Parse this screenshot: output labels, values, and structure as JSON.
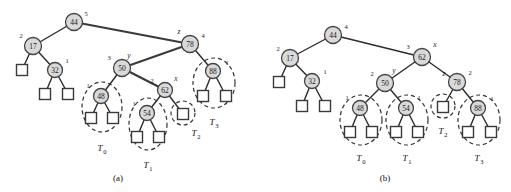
{
  "figure": {
    "kind": "avl-tree-trinode-restructuring-diagram",
    "background_color": "#ffffff",
    "node_fill_color": "#d9d9d9",
    "node_stroke_color": "#444444",
    "external_node_fill_color": "#ffffff",
    "edge_color": "#2b2b2b",
    "subtree_outline_color": "#333333"
  },
  "panels": [
    {
      "id": "a",
      "caption": "(a)",
      "caption_pos": {
        "x": 118,
        "y": 178
      },
      "nodes": [
        {
          "name": "node-44",
          "key": "44",
          "x": 74,
          "y": 22,
          "r": 8.5,
          "height": "5",
          "height_pos": {
            "x": 86,
            "y": 13
          },
          "var": "",
          "var_pos": null
        },
        {
          "name": "node-17",
          "key": "17",
          "x": 33,
          "y": 46,
          "r": 8.5,
          "height": "2",
          "height_pos": {
            "x": 21,
            "y": 35
          },
          "var": "",
          "var_pos": null
        },
        {
          "name": "node-32",
          "key": "32",
          "x": 55,
          "y": 70,
          "r": 7.5,
          "height": "1",
          "height_pos": {
            "x": 67,
            "y": 60
          },
          "var": "",
          "var_pos": null
        },
        {
          "name": "node-78",
          "key": "78",
          "x": 190,
          "y": 44,
          "r": 8.5,
          "height": "4",
          "height_pos": {
            "x": 203,
            "y": 35
          },
          "var": "z",
          "var_pos": {
            "x": 179,
            "y": 31
          }
        },
        {
          "name": "node-50",
          "key": "50",
          "x": 122,
          "y": 68,
          "r": 8.5,
          "height": "3",
          "height_pos": {
            "x": 109,
            "y": 57
          },
          "var": "y",
          "var_pos": {
            "x": 129,
            "y": 55
          }
        },
        {
          "name": "node-88",
          "key": "88",
          "x": 213,
          "y": 71,
          "r": 7.5,
          "height": "1",
          "height_pos": {
            "x": 227,
            "y": 62
          },
          "var": "",
          "var_pos": null
        },
        {
          "name": "node-48",
          "key": "48",
          "x": 101,
          "y": 96,
          "r": 7.5,
          "height": "1",
          "height_pos": {
            "x": 88,
            "y": 85
          },
          "var": "",
          "var_pos": null
        },
        {
          "name": "node-62",
          "key": "62",
          "x": 165,
          "y": 90,
          "r": 7.5,
          "height": "2",
          "height_pos": {
            "x": 152,
            "y": 80
          },
          "var": "x",
          "var_pos": {
            "x": 176,
            "y": 78
          }
        },
        {
          "name": "node-54",
          "key": "54",
          "x": 147,
          "y": 113,
          "r": 7.5,
          "height": "1",
          "height_pos": {
            "x": 134,
            "y": 103
          },
          "var": "",
          "var_pos": null
        }
      ],
      "external_nodes": [
        {
          "name": "ext-17-left",
          "x": 22,
          "y": 70,
          "size": 11
        },
        {
          "name": "ext-32-left",
          "x": 45,
          "y": 94,
          "size": 11
        },
        {
          "name": "ext-32-right",
          "x": 68,
          "y": 94,
          "size": 11
        },
        {
          "name": "ext-48-left",
          "x": 91,
          "y": 118,
          "size": 11
        },
        {
          "name": "ext-48-right",
          "x": 113,
          "y": 118,
          "size": 11
        },
        {
          "name": "ext-54-left",
          "x": 137,
          "y": 137,
          "size": 11
        },
        {
          "name": "ext-54-right",
          "x": 159,
          "y": 137,
          "size": 11
        },
        {
          "name": "ext-62-right",
          "x": 183,
          "y": 114,
          "size": 11
        },
        {
          "name": "ext-88-left",
          "x": 203,
          "y": 96,
          "size": 11
        },
        {
          "name": "ext-88-right",
          "x": 226,
          "y": 96,
          "size": 11
        }
      ],
      "edges": [
        {
          "name": "edge-44-17",
          "x1": 74,
          "y1": 22,
          "x2": 33,
          "y2": 46,
          "thick": false
        },
        {
          "name": "edge-44-78",
          "x1": 74,
          "y1": 22,
          "x2": 190,
          "y2": 44,
          "thick": true
        },
        {
          "name": "edge-17-ext",
          "x1": 33,
          "y1": 46,
          "x2": 22,
          "y2": 70,
          "thick": false
        },
        {
          "name": "edge-17-32",
          "x1": 33,
          "y1": 46,
          "x2": 55,
          "y2": 70,
          "thick": false
        },
        {
          "name": "edge-32-extl",
          "x1": 55,
          "y1": 70,
          "x2": 45,
          "y2": 94,
          "thick": false
        },
        {
          "name": "edge-32-extr",
          "x1": 55,
          "y1": 70,
          "x2": 68,
          "y2": 94,
          "thick": false
        },
        {
          "name": "edge-78-50",
          "x1": 190,
          "y1": 44,
          "x2": 122,
          "y2": 68,
          "thick": true
        },
        {
          "name": "edge-78-88",
          "x1": 190,
          "y1": 44,
          "x2": 213,
          "y2": 71,
          "thick": false
        },
        {
          "name": "edge-50-48",
          "x1": 122,
          "y1": 68,
          "x2": 101,
          "y2": 96,
          "thick": false
        },
        {
          "name": "edge-50-62",
          "x1": 122,
          "y1": 68,
          "x2": 165,
          "y2": 90,
          "thick": true
        },
        {
          "name": "edge-48-extl",
          "x1": 101,
          "y1": 96,
          "x2": 91,
          "y2": 118,
          "thick": false
        },
        {
          "name": "edge-48-extr",
          "x1": 101,
          "y1": 96,
          "x2": 113,
          "y2": 118,
          "thick": false
        },
        {
          "name": "edge-62-54",
          "x1": 165,
          "y1": 90,
          "x2": 147,
          "y2": 113,
          "thick": false
        },
        {
          "name": "edge-62-extr",
          "x1": 165,
          "y1": 90,
          "x2": 183,
          "y2": 114,
          "thick": false
        },
        {
          "name": "edge-54-extl",
          "x1": 147,
          "y1": 113,
          "x2": 137,
          "y2": 137,
          "thick": false
        },
        {
          "name": "edge-54-extr",
          "x1": 147,
          "y1": 113,
          "x2": 159,
          "y2": 137,
          "thick": false
        },
        {
          "name": "edge-88-extl",
          "x1": 213,
          "y1": 71,
          "x2": 203,
          "y2": 96,
          "thick": false
        },
        {
          "name": "edge-88-extr",
          "x1": 213,
          "y1": 71,
          "x2": 226,
          "y2": 96,
          "thick": false
        }
      ],
      "subtrees": [
        {
          "name": "subtree-T0",
          "label": "T",
          "sub": "0",
          "label_pos": {
            "x": 102,
            "y": 148
          },
          "outline": {
            "cx": 102,
            "cy": 107,
            "rx": 20,
            "ry": 25
          }
        },
        {
          "name": "subtree-T1",
          "label": "T",
          "sub": "1",
          "label_pos": {
            "x": 148,
            "y": 165
          },
          "outline": {
            "cx": 148,
            "cy": 124,
            "rx": 19,
            "ry": 26
          }
        },
        {
          "name": "subtree-T2",
          "label": "T",
          "sub": "2",
          "label_pos": {
            "x": 196,
            "y": 133
          },
          "outline": {
            "cx": 183,
            "cy": 113,
            "rx": 12,
            "ry": 12
          }
        },
        {
          "name": "subtree-T3",
          "label": "T",
          "sub": "3",
          "label_pos": {
            "x": 214,
            "y": 122
          },
          "outline": {
            "cx": 214,
            "cy": 83,
            "rx": 21,
            "ry": 25
          }
        }
      ]
    },
    {
      "id": "b",
      "caption": "(b)",
      "caption_pos": {
        "x": 385,
        "y": 178
      },
      "nodes": [
        {
          "name": "node-44",
          "key": "44",
          "x": 333,
          "y": 35,
          "r": 8.5,
          "height": "4",
          "height_pos": {
            "x": 346,
            "y": 26
          },
          "var": "",
          "var_pos": null
        },
        {
          "name": "node-17",
          "key": "17",
          "x": 290,
          "y": 58,
          "r": 8.5,
          "height": "2",
          "height_pos": {
            "x": 278,
            "y": 48
          },
          "var": "",
          "var_pos": null
        },
        {
          "name": "node-32",
          "key": "32",
          "x": 312,
          "y": 81,
          "r": 7.5,
          "height": "1",
          "height_pos": {
            "x": 325,
            "y": 71
          },
          "var": "",
          "var_pos": null
        },
        {
          "name": "node-62",
          "key": "62",
          "x": 422,
          "y": 57,
          "r": 8.5,
          "height": "3",
          "height_pos": {
            "x": 408,
            "y": 46
          },
          "var": "x",
          "var_pos": {
            "x": 435,
            "y": 44
          }
        },
        {
          "name": "node-50",
          "key": "50",
          "x": 385,
          "y": 83,
          "r": 8.5,
          "height": "2",
          "height_pos": {
            "x": 372,
            "y": 73
          },
          "var": "y",
          "var_pos": {
            "x": 394,
            "y": 70
          }
        },
        {
          "name": "node-78",
          "key": "78",
          "x": 457,
          "y": 82,
          "r": 8.5,
          "height": "2",
          "height_pos": {
            "x": 470,
            "y": 72
          },
          "var": "z",
          "var_pos": {
            "x": 444,
            "y": 73
          }
        },
        {
          "name": "node-48",
          "key": "48",
          "x": 360,
          "y": 108,
          "r": 7.5,
          "height": "1",
          "height_pos": {
            "x": 347,
            "y": 97
          },
          "var": "",
          "var_pos": null
        },
        {
          "name": "node-54",
          "key": "54",
          "x": 406,
          "y": 108,
          "r": 7.5,
          "height": "1",
          "height_pos": {
            "x": 419,
            "y": 97
          },
          "var": "",
          "var_pos": null
        },
        {
          "name": "node-88",
          "key": "88",
          "x": 478,
          "y": 108,
          "r": 7.5,
          "height": "1",
          "height_pos": {
            "x": 492,
            "y": 98
          },
          "var": "",
          "var_pos": null
        }
      ],
      "external_nodes": [
        {
          "name": "ext-17-left",
          "x": 279,
          "y": 82,
          "size": 11
        },
        {
          "name": "ext-32-left",
          "x": 302,
          "y": 106,
          "size": 11
        },
        {
          "name": "ext-32-right",
          "x": 325,
          "y": 106,
          "size": 11
        },
        {
          "name": "ext-48-left",
          "x": 350,
          "y": 132,
          "size": 11
        },
        {
          "name": "ext-48-right",
          "x": 372,
          "y": 132,
          "size": 11
        },
        {
          "name": "ext-54-left",
          "x": 396,
          "y": 132,
          "size": 11
        },
        {
          "name": "ext-54-right",
          "x": 418,
          "y": 132,
          "size": 11
        },
        {
          "name": "ext-78-left",
          "x": 443,
          "y": 107,
          "size": 11
        },
        {
          "name": "ext-88-left",
          "x": 468,
          "y": 132,
          "size": 11
        },
        {
          "name": "ext-88-right",
          "x": 491,
          "y": 132,
          "size": 11
        }
      ],
      "edges": [
        {
          "name": "edge-44-17",
          "x1": 333,
          "y1": 35,
          "x2": 290,
          "y2": 58,
          "thick": false
        },
        {
          "name": "edge-44-62",
          "x1": 333,
          "y1": 35,
          "x2": 422,
          "y2": 57,
          "thick": false
        },
        {
          "name": "edge-17-ext",
          "x1": 290,
          "y1": 58,
          "x2": 279,
          "y2": 82,
          "thick": false
        },
        {
          "name": "edge-17-32",
          "x1": 290,
          "y1": 58,
          "x2": 312,
          "y2": 81,
          "thick": false
        },
        {
          "name": "edge-32-extl",
          "x1": 312,
          "y1": 81,
          "x2": 302,
          "y2": 106,
          "thick": false
        },
        {
          "name": "edge-32-extr",
          "x1": 312,
          "y1": 81,
          "x2": 325,
          "y2": 106,
          "thick": false
        },
        {
          "name": "edge-62-50",
          "x1": 422,
          "y1": 57,
          "x2": 385,
          "y2": 83,
          "thick": false
        },
        {
          "name": "edge-62-78",
          "x1": 422,
          "y1": 57,
          "x2": 457,
          "y2": 82,
          "thick": false
        },
        {
          "name": "edge-50-48",
          "x1": 385,
          "y1": 83,
          "x2": 360,
          "y2": 108,
          "thick": false
        },
        {
          "name": "edge-50-54",
          "x1": 385,
          "y1": 83,
          "x2": 406,
          "y2": 108,
          "thick": false
        },
        {
          "name": "edge-78-ext",
          "x1": 457,
          "y1": 82,
          "x2": 443,
          "y2": 107,
          "thick": false
        },
        {
          "name": "edge-78-88",
          "x1": 457,
          "y1": 82,
          "x2": 478,
          "y2": 108,
          "thick": false
        },
        {
          "name": "edge-48-extl",
          "x1": 360,
          "y1": 108,
          "x2": 350,
          "y2": 132,
          "thick": false
        },
        {
          "name": "edge-48-extr",
          "x1": 360,
          "y1": 108,
          "x2": 372,
          "y2": 132,
          "thick": false
        },
        {
          "name": "edge-54-extl",
          "x1": 406,
          "y1": 108,
          "x2": 396,
          "y2": 132,
          "thick": false
        },
        {
          "name": "edge-54-extr",
          "x1": 406,
          "y1": 108,
          "x2": 418,
          "y2": 132,
          "thick": false
        },
        {
          "name": "edge-88-extl",
          "x1": 478,
          "y1": 108,
          "x2": 468,
          "y2": 132,
          "thick": false
        },
        {
          "name": "edge-88-extr",
          "x1": 478,
          "y1": 108,
          "x2": 491,
          "y2": 132,
          "thick": false
        }
      ],
      "subtrees": [
        {
          "name": "subtree-T0",
          "label": "T",
          "sub": "0",
          "label_pos": {
            "x": 361,
            "y": 158
          },
          "outline": {
            "cx": 361,
            "cy": 120,
            "rx": 21,
            "ry": 25
          }
        },
        {
          "name": "subtree-T1",
          "label": "T",
          "sub": "1",
          "label_pos": {
            "x": 407,
            "y": 158
          },
          "outline": {
            "cx": 407,
            "cy": 120,
            "rx": 21,
            "ry": 25
          }
        },
        {
          "name": "subtree-T2",
          "label": "T",
          "sub": "2",
          "label_pos": {
            "x": 443,
            "y": 131
          },
          "outline": {
            "cx": 443,
            "cy": 106,
            "rx": 12,
            "ry": 12
          }
        },
        {
          "name": "subtree-T3",
          "label": "T",
          "sub": "3",
          "label_pos": {
            "x": 479,
            "y": 158
          },
          "outline": {
            "cx": 479,
            "cy": 120,
            "rx": 21,
            "ry": 25
          }
        }
      ]
    }
  ]
}
